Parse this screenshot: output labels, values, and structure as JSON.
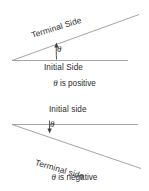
{
  "figure": {
    "background_color": "#ffffff",
    "line_color": "#9a9a9a",
    "arrow_color": "#3d3d3d",
    "text_color": "#2b2b2b"
  },
  "panels": [
    {
      "id": "positive",
      "terminal_label": "Terminal Side",
      "initial_label": "Initial Side",
      "angle_symbol": "θ",
      "caption_symbol": "θ",
      "caption_text": "is positive",
      "rotation_direction": "counterclockwise",
      "terminal_ray_angle_deg": 17.5
    },
    {
      "id": "negative",
      "terminal_label": "Terminal side",
      "initial_label": "Initial side",
      "angle_symbol": "θ",
      "caption_symbol": "θ",
      "caption_text": "is negative",
      "rotation_direction": "clockwise",
      "terminal_ray_angle_deg": -16
    }
  ]
}
